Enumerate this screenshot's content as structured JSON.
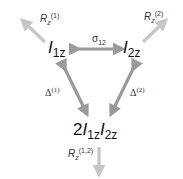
{
  "nodes": {
    "i1z": {
      "base": "I",
      "sub": "1z"
    },
    "i2z": {
      "base": "I",
      "sub": "2z"
    },
    "product": {
      "coef": "2",
      "a_base": "I",
      "a_sub": "1z",
      "b_base": "I",
      "b_sub": "2z"
    }
  },
  "edges": {
    "sigma12": {
      "symbol": "σ",
      "sub": "12"
    },
    "delta1": {
      "symbol": "Δ",
      "sup": "(1)"
    },
    "delta2": {
      "symbol": "Δ",
      "sup": "(2)"
    },
    "r1": {
      "symbol": "R",
      "sub": "z",
      "sup": "(1)"
    },
    "r2": {
      "symbol": "R",
      "sub": "z",
      "sup": "(2)"
    },
    "r12": {
      "symbol": "R",
      "sub": "z",
      "sup": "(1,2)"
    }
  },
  "colors": {
    "exchange_arrow": "#9a9a9a",
    "relaxation_arrow": "#c4c4c4"
  }
}
